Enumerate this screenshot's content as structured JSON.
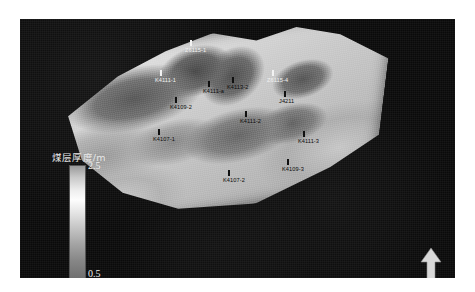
{
  "figure": {
    "type": "3d-surface-map",
    "background_color": "#0a0a0a",
    "frame_color": "#ffffff"
  },
  "legend": {
    "title": "煤层厚度/m",
    "max_label": "2.5",
    "min_label": "0.5",
    "orientation": "vertical",
    "gradient_top_color": "#9a9a9a",
    "gradient_mid_color": "#fdfdfd",
    "gradient_bottom_color": "#6e6e6e"
  },
  "north_arrow": {
    "name": "north-arrow",
    "direction": "up",
    "color": "#d8d8d8"
  },
  "wells": [
    {
      "label": "Z6115-1",
      "x": 190,
      "y": 40,
      "tone": "light"
    },
    {
      "label": "K4111-1",
      "x": 160,
      "y": 70,
      "tone": "light"
    },
    {
      "label": "K4111-a",
      "x": 208,
      "y": 81,
      "tone": "dark"
    },
    {
      "label": "K4113-2",
      "x": 232,
      "y": 77,
      "tone": "dark"
    },
    {
      "label": "Z6115-4",
      "x": 272,
      "y": 70,
      "tone": "light"
    },
    {
      "label": "K4109-2",
      "x": 175,
      "y": 97,
      "tone": "dark"
    },
    {
      "label": "J4211",
      "x": 284,
      "y": 91,
      "tone": "dark"
    },
    {
      "label": "K4111-2",
      "x": 245,
      "y": 111,
      "tone": "dark"
    },
    {
      "label": "K4107-1",
      "x": 158,
      "y": 129,
      "tone": "dark"
    },
    {
      "label": "K4111-3",
      "x": 303,
      "y": 131,
      "tone": "dark"
    },
    {
      "label": "K4109-3",
      "x": 287,
      "y": 159,
      "tone": "dark"
    },
    {
      "label": "K4107-2",
      "x": 228,
      "y": 170,
      "tone": "dark"
    }
  ],
  "chart_data": {
    "type": "heatmap",
    "title": "",
    "subtitle": "",
    "xlabel": "",
    "ylabel": "",
    "colorbar_label": "煤层厚度/m",
    "colorbar_range": [
      0.5,
      2.5
    ],
    "units": "m",
    "grid": false,
    "legend_position": "left",
    "series": [
      {
        "name": "煤层厚度/m",
        "points": [
          {
            "well": "Z6115-1",
            "x": 190,
            "y": 40
          },
          {
            "well": "K4111-1",
            "x": 160,
            "y": 70
          },
          {
            "well": "K4111-a",
            "x": 208,
            "y": 81
          },
          {
            "well": "K4113-2",
            "x": 232,
            "y": 77
          },
          {
            "well": "Z6115-4",
            "x": 272,
            "y": 70
          },
          {
            "well": "K4109-2",
            "x": 175,
            "y": 97
          },
          {
            "well": "J4211",
            "x": 284,
            "y": 91
          },
          {
            "well": "K4111-2",
            "x": 245,
            "y": 111
          },
          {
            "well": "K4107-1",
            "x": 158,
            "y": 129
          },
          {
            "well": "K4111-3",
            "x": 303,
            "y": 131
          },
          {
            "well": "K4109-3",
            "x": 287,
            "y": 159
          },
          {
            "well": "K4107-2",
            "x": 228,
            "y": 170
          }
        ]
      }
    ]
  }
}
